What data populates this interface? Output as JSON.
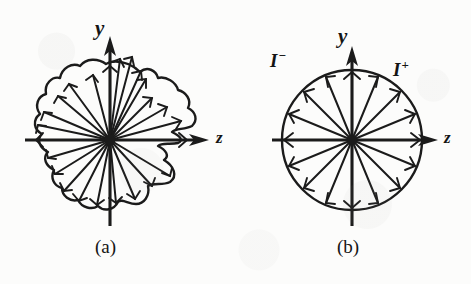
{
  "figure": {
    "kind": "scientific-diagram",
    "background_color": "#fcfcfb",
    "ink_color": "#1b1b1b",
    "panels": [
      {
        "id": "a",
        "caption": "(a)",
        "shape": "irregular-lobed-blob",
        "ray_count": 24,
        "center": {
          "x": 110,
          "y": 140
        },
        "axes": [
          {
            "name": "y-axis",
            "label": "y",
            "direction": "up"
          },
          {
            "name": "z-axis",
            "label": "z",
            "direction": "right"
          }
        ],
        "radii": [
          78,
          74,
          66,
          60,
          70,
          80,
          86,
          84,
          76,
          66,
          58,
          52,
          46,
          40,
          48,
          62,
          72,
          80,
          86,
          82,
          74,
          64,
          58,
          70
        ]
      },
      {
        "id": "b",
        "caption": "(b)",
        "shape": "circle",
        "ray_count": 16,
        "radius": 70,
        "center": {
          "x": 352,
          "y": 140
        },
        "axes": [
          {
            "name": "y-axis",
            "label": "y",
            "direction": "up"
          },
          {
            "name": "z-axis",
            "label": "z",
            "direction": "right"
          }
        ],
        "region_labels": [
          {
            "name": "negative-current",
            "symbol": "I",
            "superscript": "−",
            "position": "upper-left"
          },
          {
            "name": "positive-current",
            "symbol": "I",
            "superscript": "+",
            "position": "upper-right"
          }
        ]
      }
    ]
  },
  "labels": {
    "panel_a_y": "y",
    "panel_a_z": "z",
    "panel_a_caption": "(a)",
    "panel_b_y": "y",
    "panel_b_z": "z",
    "panel_b_caption": "(b)",
    "current_minus_symbol": "I",
    "current_minus_sup": "−",
    "current_plus_symbol": "I",
    "current_plus_sup": "+"
  }
}
